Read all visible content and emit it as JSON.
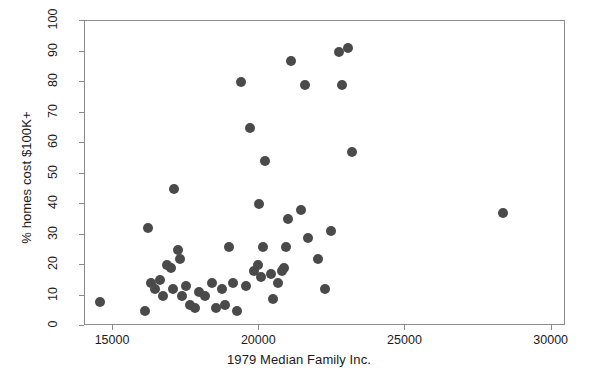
{
  "chart_data": {
    "type": "scatter",
    "title": "",
    "xlabel": "1979 Median Family Inc.",
    "ylabel": "% homes cost $100K+",
    "xlim": [
      14040,
      30490
    ],
    "ylim": [
      0,
      100
    ],
    "xticks": [
      15000,
      20000,
      25000,
      30000
    ],
    "xtick_labels": [
      "15000",
      "20000",
      "25000",
      "30000"
    ],
    "yticks": [
      0,
      10,
      20,
      30,
      40,
      50,
      60,
      70,
      80,
      90,
      100
    ],
    "ytick_labels": [
      "0",
      "10",
      "20",
      "30",
      "40",
      "50",
      "60",
      "70",
      "80",
      "90",
      "100"
    ],
    "grid": false,
    "legend": false,
    "marker_color": "#4a4a4a",
    "marker_size": 10,
    "frame_color": "#8a8a8a",
    "n_points": 51,
    "points": [
      {
        "x": 14540,
        "y": 8
      },
      {
        "x": 16080,
        "y": 5
      },
      {
        "x": 16180,
        "y": 32
      },
      {
        "x": 16300,
        "y": 14
      },
      {
        "x": 16430,
        "y": 12
      },
      {
        "x": 16590,
        "y": 15
      },
      {
        "x": 16720,
        "y": 10
      },
      {
        "x": 16850,
        "y": 20
      },
      {
        "x": 16980,
        "y": 19
      },
      {
        "x": 17040,
        "y": 12
      },
      {
        "x": 17100,
        "y": 45
      },
      {
        "x": 17230,
        "y": 25
      },
      {
        "x": 17300,
        "y": 22
      },
      {
        "x": 17360,
        "y": 10
      },
      {
        "x": 17490,
        "y": 13
      },
      {
        "x": 17620,
        "y": 7
      },
      {
        "x": 17810,
        "y": 6
      },
      {
        "x": 17940,
        "y": 11
      },
      {
        "x": 18130,
        "y": 10
      },
      {
        "x": 18390,
        "y": 14
      },
      {
        "x": 18520,
        "y": 6
      },
      {
        "x": 18710,
        "y": 12
      },
      {
        "x": 18840,
        "y": 7
      },
      {
        "x": 18970,
        "y": 26
      },
      {
        "x": 19100,
        "y": 14
      },
      {
        "x": 19230,
        "y": 5
      },
      {
        "x": 19360,
        "y": 80
      },
      {
        "x": 19550,
        "y": 13
      },
      {
        "x": 19680,
        "y": 65
      },
      {
        "x": 19810,
        "y": 18
      },
      {
        "x": 19940,
        "y": 20
      },
      {
        "x": 20000,
        "y": 40
      },
      {
        "x": 20070,
        "y": 16
      },
      {
        "x": 20130,
        "y": 26
      },
      {
        "x": 20200,
        "y": 54
      },
      {
        "x": 20390,
        "y": 17
      },
      {
        "x": 20460,
        "y": 9
      },
      {
        "x": 20650,
        "y": 14
      },
      {
        "x": 20780,
        "y": 18
      },
      {
        "x": 20840,
        "y": 19
      },
      {
        "x": 20910,
        "y": 26
      },
      {
        "x": 20970,
        "y": 35
      },
      {
        "x": 21100,
        "y": 87
      },
      {
        "x": 21420,
        "y": 38
      },
      {
        "x": 21550,
        "y": 79
      },
      {
        "x": 21680,
        "y": 29
      },
      {
        "x": 22000,
        "y": 22
      },
      {
        "x": 22260,
        "y": 12
      },
      {
        "x": 22450,
        "y": 31
      },
      {
        "x": 22710,
        "y": 90
      },
      {
        "x": 22840,
        "y": 79
      },
      {
        "x": 23030,
        "y": 91
      },
      {
        "x": 23160,
        "y": 57
      },
      {
        "x": 28350,
        "y": 37
      }
    ]
  }
}
